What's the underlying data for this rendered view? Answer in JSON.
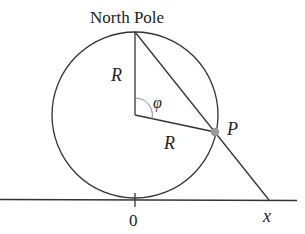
{
  "diagram": {
    "title_label": "North Pole",
    "radius_label_vertical": "R",
    "radius_label_slant": "R",
    "angle_label": "φ",
    "point_label": "P",
    "origin_label": "0",
    "x_label": "x",
    "colors": {
      "stroke": "#333333",
      "point": "#999999",
      "angle_arc": "#888888"
    }
  }
}
